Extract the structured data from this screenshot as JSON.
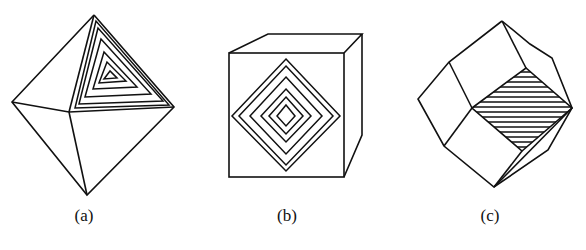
{
  "figure": {
    "panels": [
      {
        "id": "a",
        "label": "(a)",
        "shape": "octahedron",
        "face_pattern": "nested-triangles"
      },
      {
        "id": "b",
        "label": "(b)",
        "shape": "cube",
        "face_pattern": "nested-squares"
      },
      {
        "id": "c",
        "label": "(c)",
        "shape": "rhombic-dodecahedron",
        "face_pattern": "parallel-hatching"
      }
    ]
  },
  "colors": {
    "stroke": "#111111",
    "background": "#ffffff"
  }
}
